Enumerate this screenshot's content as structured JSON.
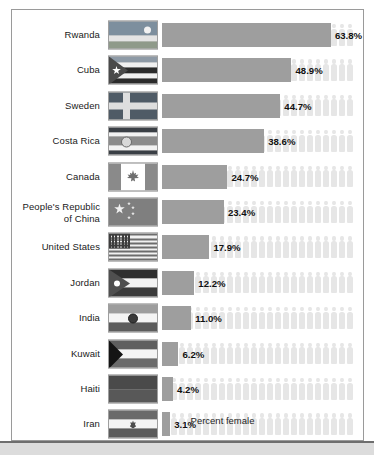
{
  "figure": {
    "axis_caption": "Percent female",
    "value_suffix": "%",
    "colors": {
      "bar": "#9e9e9e",
      "pictogram": "#e6e6e6",
      "frame": "#9a9a9a",
      "text": "#1a1a1a",
      "value_text": "#111111",
      "bottom_band": "#dcdcdc"
    }
  },
  "chart_data": {
    "type": "bar",
    "title": "",
    "subtitle": "",
    "xlabel": "Percent female",
    "ylabel": "",
    "xlim": [
      0,
      63.8
    ],
    "grid": false,
    "orientation": "horizontal",
    "legend": "none",
    "value_format": "0.0%",
    "categories": [
      "Rwanda",
      "Cuba",
      "Sweden",
      "Costa Rica",
      "People's Republic of China",
      "Canada",
      "United States",
      "Jordan",
      "India",
      "Kuwait",
      "Haiti",
      "Iran"
    ],
    "values": [
      63.8,
      48.9,
      44.7,
      38.6,
      23.4,
      24.7,
      17.9,
      12.2,
      11.0,
      6.2,
      4.2,
      3.1
    ],
    "rows": [
      {
        "country": "Rwanda",
        "label_lines": [
          "Rwanda"
        ],
        "value": 63.8,
        "value_text": "63.8%",
        "flag": "rwanda"
      },
      {
        "country": "Cuba",
        "label_lines": [
          "Cuba"
        ],
        "value": 48.9,
        "value_text": "48.9%",
        "flag": "cuba"
      },
      {
        "country": "Sweden",
        "label_lines": [
          "Sweden"
        ],
        "value": 44.7,
        "value_text": "44.7%",
        "flag": "sweden"
      },
      {
        "country": "Costa Rica",
        "label_lines": [
          "Costa Rica"
        ],
        "value": 38.6,
        "value_text": "38.6%",
        "flag": "costa-rica"
      },
      {
        "country": "Canada",
        "label_lines": [
          "Canada"
        ],
        "value": 24.7,
        "value_text": "24.7%",
        "flag": "canada"
      },
      {
        "country": "People's Republic of China",
        "label_lines": [
          "People's Republic",
          "of China"
        ],
        "value": 23.4,
        "value_text": "23.4%",
        "flag": "china"
      },
      {
        "country": "United States",
        "label_lines": [
          "United States"
        ],
        "value": 17.9,
        "value_text": "17.9%",
        "flag": "usa"
      },
      {
        "country": "Jordan",
        "label_lines": [
          "Jordan"
        ],
        "value": 12.2,
        "value_text": "12.2%",
        "flag": "jordan"
      },
      {
        "country": "India",
        "label_lines": [
          "India"
        ],
        "value": 11.0,
        "value_text": "11.0%",
        "flag": "india"
      },
      {
        "country": "Kuwait",
        "label_lines": [
          "Kuwait"
        ],
        "value": 6.2,
        "value_text": "6.2%",
        "flag": "kuwait"
      },
      {
        "country": "Haiti",
        "label_lines": [
          "Haiti"
        ],
        "value": 4.2,
        "value_text": "4.2%",
        "flag": "haiti"
      },
      {
        "country": "Iran",
        "label_lines": [
          "Iran"
        ],
        "value": 3.1,
        "value_text": "3.1%",
        "flag": "iran"
      }
    ]
  }
}
